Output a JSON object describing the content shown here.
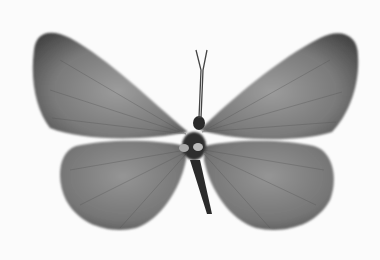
{
  "image": {
    "subject": "butterfly specimen, dorsal view",
    "style": "grayscale photograph",
    "background_color": "#fbfbfb",
    "wing_color": "#6a6a6a",
    "wing_highlight": "#9a9a9a",
    "body_color": "#2a2a2a"
  }
}
